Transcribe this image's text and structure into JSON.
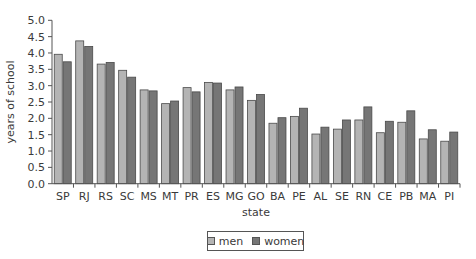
{
  "chart_data": {
    "type": "bar",
    "title": "",
    "xlabel": "state",
    "ylabel": "years of school",
    "ylim": [
      0,
      5.0
    ],
    "yticks": [
      "0.0",
      "0.5",
      "1.0",
      "1.5",
      "2.0",
      "2.5",
      "3.0",
      "3.5",
      "4.0",
      "4.5",
      "5.0"
    ],
    "grid": false,
    "legend_position": "bottom",
    "categories": [
      "SP",
      "RJ",
      "RS",
      "SC",
      "MS",
      "MT",
      "PR",
      "ES",
      "MG",
      "GO",
      "BA",
      "PE",
      "AL",
      "SE",
      "RN",
      "CE",
      "PB",
      "MA",
      "PI"
    ],
    "series": [
      {
        "name": "men",
        "color": "#b4b4b4",
        "values": [
          3.96,
          4.37,
          3.66,
          3.47,
          2.87,
          2.45,
          2.94,
          3.1,
          2.87,
          2.55,
          1.85,
          2.06,
          1.52,
          1.67,
          1.95,
          1.56,
          1.88,
          1.37,
          1.3
        ]
      },
      {
        "name": "women",
        "color": "#767676",
        "values": [
          3.73,
          4.2,
          3.71,
          3.26,
          2.84,
          2.53,
          2.81,
          3.08,
          2.96,
          2.73,
          2.02,
          2.31,
          1.73,
          1.95,
          2.35,
          1.91,
          2.23,
          1.65,
          1.58
        ]
      }
    ]
  },
  "legend": {
    "men": "men",
    "women": "women"
  }
}
